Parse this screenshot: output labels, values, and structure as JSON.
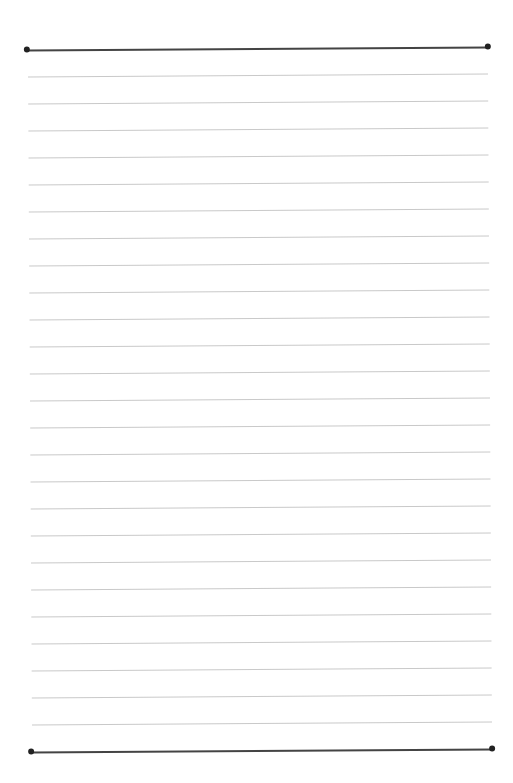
{
  "page": {
    "type": "lined-paper",
    "background": "#ffffff",
    "rule_color": "#c9c9c9",
    "border_color": "#444444",
    "top_border_y": 48,
    "bottom_border_y": 750,
    "first_rule_y": 75,
    "rule_spacing": 27,
    "rule_count": 25
  }
}
